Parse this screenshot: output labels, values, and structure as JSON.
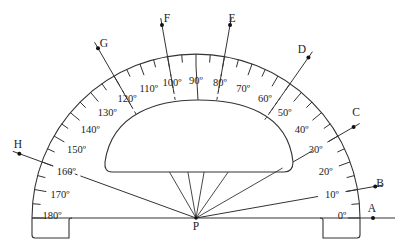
{
  "diagram": {
    "title": "",
    "type": "protractor",
    "center_label": "P",
    "scale": {
      "min": 0,
      "max": 180,
      "major_step": 10,
      "minor_step": 5,
      "labels": [
        "0º",
        "10º",
        "20º",
        "30º",
        "40º",
        "50º",
        "60º",
        "70º",
        "80º",
        "90º",
        "100º",
        "110º",
        "120º",
        "130º",
        "140º",
        "150º",
        "160º",
        "170º",
        "180º"
      ]
    },
    "rays": [
      {
        "label": "A",
        "angle": 0
      },
      {
        "label": "B",
        "angle": 10
      },
      {
        "label": "C",
        "angle": 30
      },
      {
        "label": "D",
        "angle": 55
      },
      {
        "label": "E",
        "angle": 80
      },
      {
        "label": "F",
        "angle": 100
      },
      {
        "label": "G",
        "angle": 120
      },
      {
        "label": "H",
        "angle": 160
      }
    ],
    "colors": {
      "stroke": "#333333",
      "text": "#222222",
      "background": "#ffffff"
    }
  }
}
